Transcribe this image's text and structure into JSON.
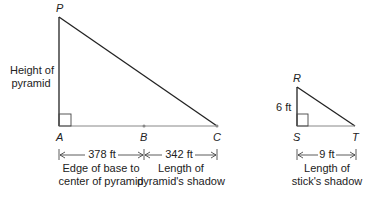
{
  "large_triangle": {
    "vertices": {
      "top": "P",
      "right_angle": "A",
      "mid": "B",
      "end": "C"
    },
    "side_label": [
      "Height of",
      "pyramid"
    ],
    "segment_ab": {
      "value": "378 ft",
      "caption": [
        "Edge of base to",
        "center of pyramid"
      ]
    },
    "segment_bc": {
      "value": "342 ft",
      "caption": [
        "Length of",
        "pyramid's shadow"
      ]
    }
  },
  "small_triangle": {
    "vertices": {
      "top": "R",
      "right_angle": "S",
      "end": "T"
    },
    "height_label": "6 ft",
    "segment_st": {
      "value": "9 ft",
      "caption": [
        "Length of",
        "stick's shadow"
      ]
    }
  },
  "colors": {
    "line": "#222222",
    "base": "#888888"
  }
}
